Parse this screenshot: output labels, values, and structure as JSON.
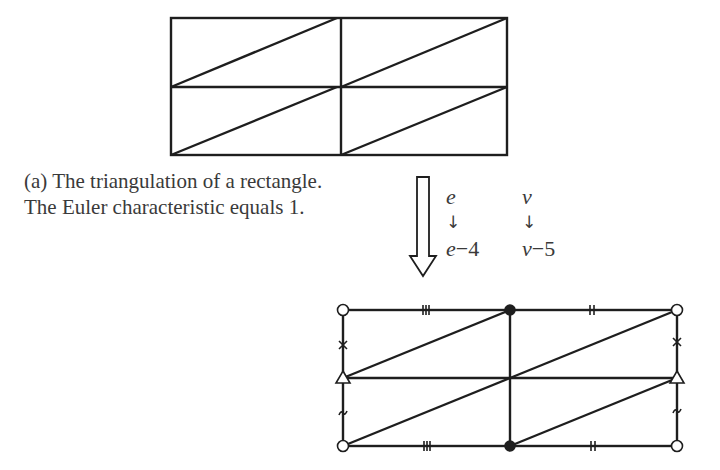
{
  "caption": {
    "line1": "(a) The triangulation of a rectangle.",
    "line2": "The Euler characteristic equals 1."
  },
  "transform": {
    "edge_from": "e",
    "edge_arrow": "↓",
    "edge_to_var": "e",
    "edge_to_op": "−4",
    "vertex_from": "v",
    "vertex_arrow": "↓",
    "vertex_to_var": "v",
    "vertex_to_op": "−5"
  },
  "colors": {
    "line": "#1e1e1e",
    "text": "#3a3a3a",
    "background": "#ffffff"
  },
  "figures": {
    "top": "rectangle-triangulation-2x2",
    "bottom": "rectangle-triangulation-with-identification-marks",
    "vertex_markers": [
      "open-circle",
      "filled-circle",
      "triangle"
    ],
    "edge_markers": [
      "triple-tick",
      "double-tick",
      "cross",
      "tilde"
    ]
  }
}
